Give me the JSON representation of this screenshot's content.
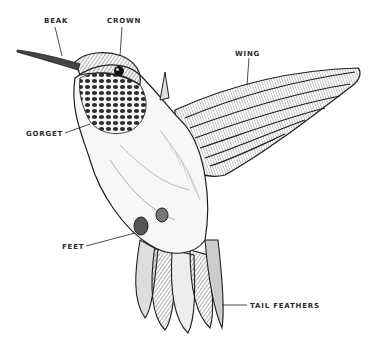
{
  "diagram": {
    "colors": {
      "ink": "#1e1e1e",
      "background": "#ffffff",
      "label": "#2a2a2a"
    },
    "labels": [
      {
        "id": "beak",
        "text": "BEAK",
        "x": 44,
        "y": 17
      },
      {
        "id": "crown",
        "text": "CROWN",
        "x": 107,
        "y": 17
      },
      {
        "id": "wing",
        "text": "WING",
        "x": 235,
        "y": 50
      },
      {
        "id": "gorget",
        "text": "GORGET",
        "x": 26,
        "y": 130
      },
      {
        "id": "feet",
        "text": "FEET",
        "x": 62,
        "y": 243
      },
      {
        "id": "tail-feathers",
        "text": "TAIL FEATHERS",
        "x": 250,
        "y": 302
      }
    ]
  }
}
